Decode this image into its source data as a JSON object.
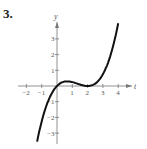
{
  "problem_number": "3.",
  "chart_data": {
    "type": "line",
    "title": "",
    "xlabel": "t",
    "ylabel": "y",
    "xlim": [
      -2.3,
      4.6
    ],
    "ylim": [
      -3.4,
      4.0
    ],
    "x_ticks": [
      -2,
      -1,
      1,
      2,
      3,
      4
    ],
    "y_ticks": [
      -3,
      -2,
      -1,
      1,
      2,
      3
    ],
    "grid": false,
    "series": [
      {
        "name": "curve",
        "x": [
          -1.3,
          -1,
          -0.5,
          0,
          0.5,
          0.67,
          1,
          1.5,
          2,
          2.5,
          3,
          3.5,
          4
        ],
        "y": [
          -3.5,
          -2.25,
          -0.78,
          0,
          0.28,
          0.3,
          0.25,
          0.09,
          0,
          0.16,
          0.75,
          1.97,
          3.6
        ]
      }
    ]
  }
}
